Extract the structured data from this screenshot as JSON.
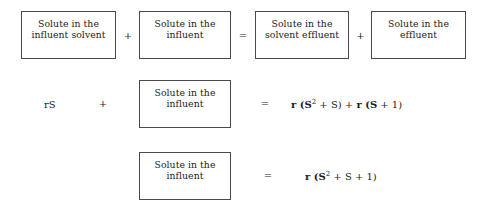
{
  "diagram": {
    "rows": [
      {
        "id": "word-equation",
        "boxes": [
          {
            "name": "influent-solvent",
            "text": "Solute in the\ninfluent solvent"
          },
          {
            "name": "influent",
            "text": "Solute in the\ninfluent"
          },
          {
            "name": "solvent-effluent",
            "text": "Solute in the\nsolvent effluent"
          },
          {
            "name": "effluent",
            "text": "Solute in the\neffluent"
          }
        ],
        "operators": [
          {
            "name": "plus-1",
            "symbol": "+"
          },
          {
            "name": "equals",
            "symbol": "="
          },
          {
            "name": "plus-2",
            "symbol": "+"
          }
        ]
      },
      {
        "id": "substituted-equation",
        "left_term": "rS",
        "plus": "+",
        "box": {
          "name": "influent",
          "text": "Solute in the\ninfluent"
        },
        "equals": "=",
        "right_term": {
          "prefix": "r (S",
          "exponent": "2",
          "middle": " + S) + ",
          "second_prefix": "r (S",
          "suffix": " + 1)"
        }
      },
      {
        "id": "simplified-equation",
        "box": {
          "name": "influent",
          "text": "Solute in the\ninfluent"
        },
        "equals": "=",
        "right_term": {
          "prefix": "r (S",
          "exponent": "2",
          "suffix": " + S + 1)"
        }
      }
    ]
  },
  "colors": {
    "background": "#ffffff",
    "text": "#1c1c1c",
    "box_border": "#4a4a4a"
  }
}
